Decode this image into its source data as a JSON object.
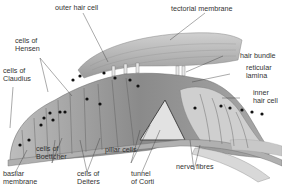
{
  "labels": {
    "outer_hair_cell": "outer hair cell",
    "tectorial_membrane": "tectorial membrane",
    "cells_of_hensen": "cells of\nHensen",
    "cells_of_claudius": "cells of\nClaudius",
    "hair_bundle": "hair bundle",
    "reticular_lamina": "reticular\nlamina",
    "inner_hair_cell": "inner\nhair cell",
    "cells_of_boettcher": "cells of\nBoettcher",
    "pillar_cells": "pillar cells",
    "basilar_membrane": "basilar\nmembrane",
    "cells_of_deiters": "cells of\nDeiters",
    "tunnel_of_corti": "tunnel\nof Corti",
    "nerve_fibres": "nerve fibres"
  },
  "colors": {
    "tectorial": "#b9b9b9",
    "cells_dark": "#7a7a7a",
    "cells_mid": "#9c9c9c",
    "cells_light": "#c9c9c9",
    "membrane": "#8f8f8f",
    "nucleus": "#111111",
    "leader": "#444444"
  }
}
